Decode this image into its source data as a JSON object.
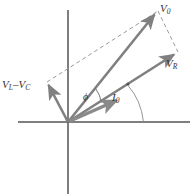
{
  "figure": {
    "background_color": "#ffffff",
    "axis_color": "#555555",
    "vector_color": "#808080",
    "dashed_color": "#999999",
    "label_color": "#333333",
    "width": 194,
    "height": 196
  },
  "axes": {
    "origin": {
      "x": 68,
      "y": 122
    },
    "horizontal": {
      "x1": 18,
      "y1": 122,
      "x2": 190,
      "y2": 122
    },
    "vertical": {
      "x1": 68,
      "y1": 10,
      "x2": 68,
      "y2": 194
    }
  },
  "labels": {
    "v0": {
      "symbol": "V",
      "subscript": "0",
      "text": "V0"
    },
    "vr": {
      "symbol": "V",
      "subscript": "R",
      "text": "VR"
    },
    "vl_minus_vc": {
      "symbol_a": "V",
      "subscript_a": "L",
      "operator": "–",
      "symbol_b": "V",
      "subscript_b": "C",
      "text": "VL – VC"
    },
    "phi": {
      "symbol": "ϕ",
      "text": "ϕ"
    },
    "i0": {
      "symbol": "I",
      "subscript": "0",
      "text": "I0"
    }
  },
  "vectors": [
    {
      "name": "v0",
      "label": "V0",
      "from": {
        "x": 68,
        "y": 122
      },
      "to": {
        "x": 158,
        "y": 11
      },
      "style": "solid",
      "color": "#808080"
    },
    {
      "name": "vr",
      "label": "VR",
      "from": {
        "x": 68,
        "y": 122
      },
      "to": {
        "x": 178,
        "y": 52
      },
      "style": "solid",
      "color": "#808080"
    },
    {
      "name": "vl-minus-vc",
      "label": "VL – VC",
      "from": {
        "x": 68,
        "y": 122
      },
      "to": {
        "x": 47,
        "y": 82
      },
      "style": "solid",
      "color": "#808080"
    },
    {
      "name": "i0",
      "label": "I0",
      "from": {
        "x": 68,
        "y": 122
      },
      "to": {
        "x": 120,
        "y": 99
      },
      "style": "solid-thick",
      "color": "#8a8a8a"
    }
  ],
  "dashed_lines": [
    {
      "name": "vlvc-to-v0",
      "from": {
        "x": 47,
        "y": 82
      },
      "to": {
        "x": 158,
        "y": 11
      }
    },
    {
      "name": "v0-to-vr",
      "from": {
        "x": 158,
        "y": 11
      },
      "to": {
        "x": 178,
        "y": 52
      }
    }
  ],
  "arcs": [
    {
      "name": "phi-angle-arc",
      "label": "ϕ",
      "center": {
        "x": 68,
        "y": 122
      },
      "radius": 34,
      "between": [
        "v0",
        "vr"
      ]
    },
    {
      "name": "i0-angle-arc",
      "label": "I0",
      "from": {
        "x": 128,
        "y": 84
      },
      "to": {
        "x": 143,
        "y": 122
      }
    }
  ],
  "markers": [
    {
      "name": "angle-vertex-dot",
      "x": 128,
      "y": 84,
      "radius": 1.6
    }
  ]
}
